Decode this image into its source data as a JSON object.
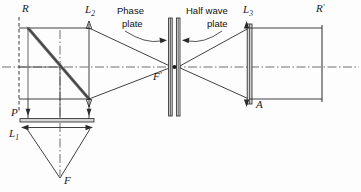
{
  "figure": {
    "type": "optical-ray-diagram",
    "title": "",
    "background_color": "#fdfdfd",
    "ink_color": "#2b2b2b"
  },
  "labels": {
    "source_aperture": {
      "text": "R",
      "subscript": ""
    },
    "image_aperture": {
      "text": "R",
      "subscript": "",
      "prime": "'"
    },
    "lens_1": {
      "text": "L",
      "subscript": "1"
    },
    "lens_2": {
      "text": "L",
      "subscript": "2"
    },
    "lens_3": {
      "text": "L",
      "subscript": "3"
    },
    "polarizer": {
      "text": "P",
      "subscript": ""
    },
    "focus_lower": {
      "text": "F",
      "subscript": ""
    },
    "focus_center": {
      "text": "F",
      "subscript": "",
      "prime": "'"
    },
    "analyzer": {
      "text": "A",
      "subscript": ""
    }
  },
  "annotations": {
    "phase_plate": {
      "line1": "Phase",
      "line2": "plate"
    },
    "half_wave_plate": {
      "line1": "Half wave",
      "line2": "plate"
    }
  },
  "components": [
    {
      "name": "aperture-R",
      "kind": "dashed-aperture",
      "x": 19
    },
    {
      "name": "beam-splitter",
      "kind": "diagonal-plate",
      "x1": 28,
      "y1": 28,
      "x2": 89,
      "y2": 99
    },
    {
      "name": "polarizer-P",
      "kind": "horizontal-plate",
      "y": 120
    },
    {
      "name": "lens-L1",
      "kind": "horizontal-lens",
      "y": 122
    },
    {
      "name": "lens-L2",
      "kind": "vertical-lens",
      "x": 89
    },
    {
      "name": "phase-plate",
      "kind": "vertical-plate",
      "x": 170
    },
    {
      "name": "half-wave-plate",
      "kind": "vertical-plate",
      "x": 179
    },
    {
      "name": "lens-L3",
      "kind": "vertical-lens",
      "x": 249
    },
    {
      "name": "aperture-R-prime",
      "kind": "solid-aperture",
      "x": 322
    }
  ],
  "axes": {
    "optical_axis_y": 67,
    "vertical_axis_x": 60
  }
}
